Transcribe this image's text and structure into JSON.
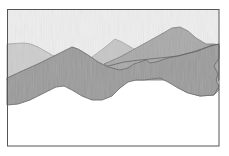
{
  "image": {
    "subject": "watercolor painting of layered mountain ridges",
    "style": "grayscale watercolor",
    "colors": {
      "background": "#ffffff",
      "sky": "#eeeeee",
      "frame": "#555555",
      "far_mountain": "#cdcdcd",
      "far_mountain_edge": "#9a9a9a",
      "middle_peak": "#c6c6c6",
      "right_mountain": "#a9a9a9",
      "front_band": "#9b9b9b",
      "ridge_line": "#666666"
    },
    "layers": [
      "sky",
      "far-left-mountain",
      "middle-peak",
      "right-mountain",
      "front-ridge-band"
    ]
  }
}
